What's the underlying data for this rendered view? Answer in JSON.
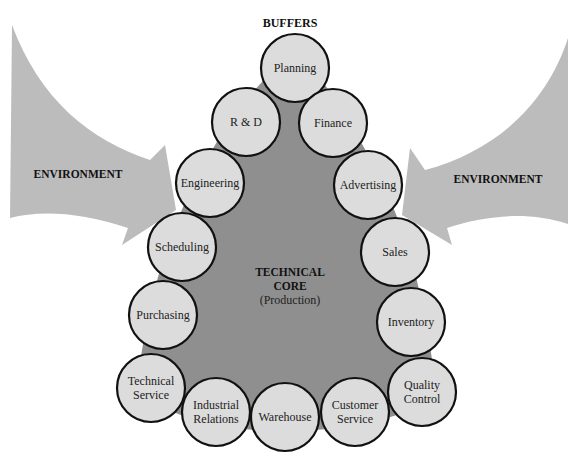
{
  "diagram": {
    "title": "BUFFERS",
    "environment_left": "ENVIRONMENT",
    "environment_right": "ENVIRONMENT",
    "core": {
      "line1": "TECHNICAL",
      "line2": "CORE",
      "line3": "(Production)"
    },
    "buffers": [
      {
        "lines": [
          "Planning"
        ]
      },
      {
        "lines": [
          "R & D"
        ]
      },
      {
        "lines": [
          "Finance"
        ]
      },
      {
        "lines": [
          "Engineering"
        ]
      },
      {
        "lines": [
          "Advertising"
        ]
      },
      {
        "lines": [
          "Scheduling"
        ]
      },
      {
        "lines": [
          "Sales"
        ]
      },
      {
        "lines": [
          "Purchasing"
        ]
      },
      {
        "lines": [
          "Inventory"
        ]
      },
      {
        "lines": [
          "Technical",
          "Service"
        ]
      },
      {
        "lines": [
          "Industrial",
          "Relations"
        ]
      },
      {
        "lines": [
          "Warehouse"
        ]
      },
      {
        "lines": [
          "Customer",
          "Service"
        ]
      },
      {
        "lines": [
          "Quality",
          "Control"
        ]
      }
    ],
    "colors": {
      "arrow": "#b8b8b8",
      "core": "#8f8f8f",
      "circle_fill": "#dcdcdc",
      "circle_stroke": "#111111"
    }
  }
}
